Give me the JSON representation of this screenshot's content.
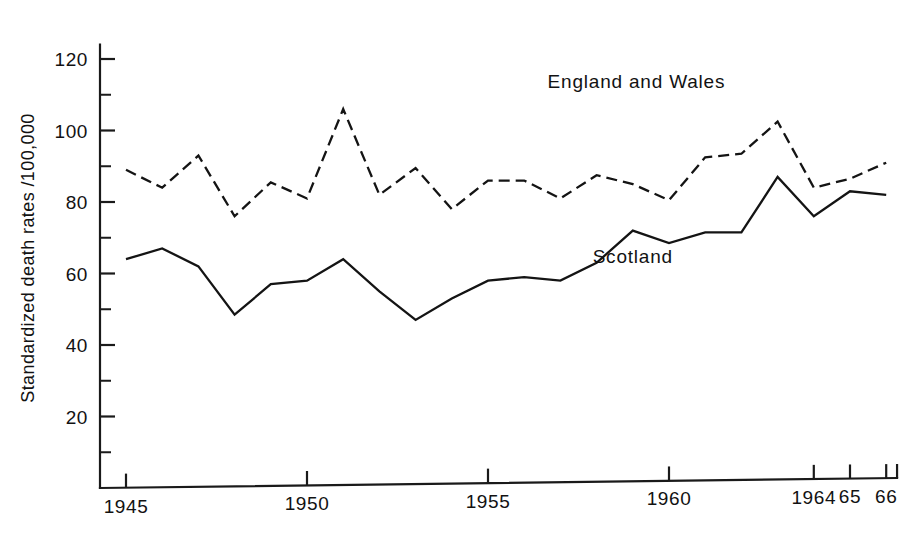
{
  "chart_data": {
    "type": "line",
    "title": "",
    "xlabel": "",
    "ylabel": "Standardized death rates /100,000",
    "xlim": [
      1944.3,
      1966.6
    ],
    "ylim": [
      0,
      124
    ],
    "grid": false,
    "legend_position": "inline-annotation",
    "x": [
      1945,
      1946,
      1947,
      1948,
      1949,
      1950,
      1951,
      1952,
      1953,
      1954,
      1955,
      1956,
      1957,
      1958,
      1959,
      1960,
      1961,
      1962,
      1963,
      1964,
      1965,
      1966
    ],
    "y_ticks": [
      20,
      40,
      60,
      80,
      100,
      120
    ],
    "y_tick_labels": [
      "20",
      "40",
      "60",
      "80",
      "100",
      "120"
    ],
    "y_minor_ticks": [
      10,
      30,
      50,
      70,
      90,
      110
    ],
    "x_ticks": [
      1945,
      1950,
      1955,
      1960,
      1964,
      1965,
      1966
    ],
    "x_tick_labels": [
      "1945",
      "1950",
      "1955",
      "1960",
      "1964",
      "65",
      "66"
    ],
    "series": [
      {
        "name": "England and Wales",
        "style": "dashed",
        "label_x": 1959.1,
        "label_y": 112,
        "values": [
          89,
          84,
          93,
          76,
          85.5,
          81,
          106,
          82,
          89.5,
          78,
          86,
          86,
          81,
          87.5,
          85,
          80.5,
          92.5,
          93.5,
          102.5,
          84,
          86.5,
          91
        ]
      },
      {
        "name": "Scotland",
        "style": "solid",
        "label_x": 1959.0,
        "label_y": 63,
        "values": [
          64,
          67,
          62,
          48.5,
          57,
          58,
          64,
          55,
          47,
          53,
          58,
          59,
          58,
          63,
          72,
          68.5,
          71.5,
          71.5,
          87,
          76,
          83,
          82
        ]
      }
    ]
  },
  "axes": {
    "y_axis_name": "y-axis",
    "x_axis_name": "x-axis"
  }
}
